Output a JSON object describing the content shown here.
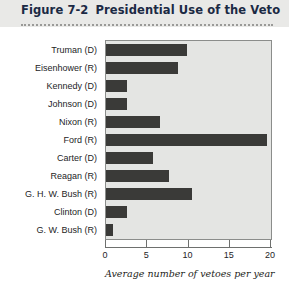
{
  "figure": {
    "number": "Figure 7-2",
    "title": "Presidential Use of the Veto"
  },
  "colors": {
    "bar": "#3a3a38",
    "plot_background": "#e4e5e3",
    "header_band": "#e9e9e7",
    "title_text": "#1b2a44",
    "axis": "#6e706e"
  },
  "chart_data": {
    "type": "bar",
    "orientation": "horizontal",
    "title": "Presidential Use of the Veto",
    "xlabel": "Average number of vetoes per year",
    "ylabel": "",
    "xlim": [
      0,
      20
    ],
    "xticks": [
      0,
      5,
      10,
      15,
      20
    ],
    "xticklabels": [
      "0",
      "5",
      "10",
      "15",
      "20"
    ],
    "grid": false,
    "legend": null,
    "categories": [
      "Truman (D)",
      "Eisenhower (R)",
      "Kennedy (D)",
      "Johnson (D)",
      "Nixon (R)",
      "Ford (R)",
      "Carter (D)",
      "Reagan (R)",
      "G. H. W. Bush (R)",
      "Clinton (D)",
      "G. W. Bush (R)"
    ],
    "values": [
      9.8,
      8.7,
      2.5,
      2.5,
      6.6,
      19.5,
      5.7,
      7.6,
      10.4,
      2.5,
      0.8
    ]
  }
}
